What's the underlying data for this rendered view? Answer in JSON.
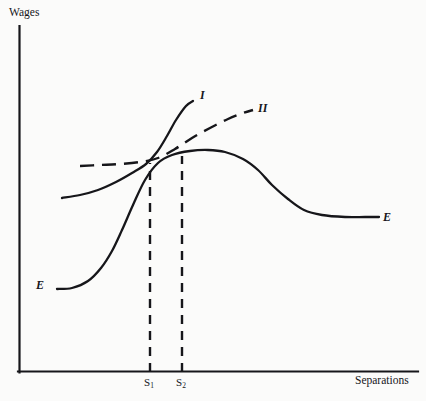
{
  "figure": {
    "background_color": "#fbfbfa",
    "ink_color": "#16161a",
    "width": 426,
    "height": 401
  },
  "axes": {
    "y_axis_label": "Wages",
    "x_axis_label": "Separations",
    "origin_px": {
      "x": 18,
      "y": 372
    },
    "x_axis_end_px": {
      "x": 418,
      "y": 372
    },
    "y_axis_top_px": {
      "x": 18,
      "y": 26
    }
  },
  "ticks": [
    {
      "name": "S1",
      "text": "S",
      "subscript": "1",
      "x_px": 150
    },
    {
      "name": "S2",
      "text": "S",
      "subscript": "2",
      "x_px": 182
    }
  ],
  "curve_labels": {
    "I": "I",
    "II": "II",
    "E_left": "E",
    "E_right": "E"
  },
  "chart_data": {
    "type": "line",
    "title": "",
    "subtitle": "",
    "xlabel": "Separations",
    "ylabel": "Wages",
    "xlim": [
      0,
      418
    ],
    "ylim": [
      0,
      372
    ],
    "grid": false,
    "legend": "inline-curve-end-labels",
    "axis_ticks_numeric": false,
    "annotations": [
      {
        "name": "s1-dropline",
        "label": "S1",
        "style": "dashed-vertical",
        "x_px": 150,
        "from_y_px": 372,
        "to_y_px": 163
      },
      {
        "name": "s2-dropline",
        "label": "S2",
        "style": "dashed-vertical",
        "x_px": 182,
        "from_y_px": 372,
        "to_y_px": 156
      }
    ],
    "series": [
      {
        "name": "E",
        "label": "E",
        "style": "solid",
        "description": "S-shaped employer wage-offer curve rising then peaking and falling",
        "points_px": [
          [
            57,
            289
          ],
          [
            72,
            288
          ],
          [
            88,
            281
          ],
          [
            101,
            268
          ],
          [
            112,
            251
          ],
          [
            122,
            230
          ],
          [
            133,
            205
          ],
          [
            145,
            180
          ],
          [
            158,
            163
          ],
          [
            172,
            155
          ],
          [
            190,
            151
          ],
          [
            208,
            150
          ],
          [
            225,
            152
          ],
          [
            243,
            159
          ],
          [
            258,
            170
          ],
          [
            272,
            185
          ],
          [
            288,
            199
          ],
          [
            304,
            210
          ],
          [
            322,
            215
          ],
          [
            345,
            217
          ],
          [
            365,
            217
          ],
          [
            379,
            217
          ]
        ]
      },
      {
        "name": "I",
        "label": "I",
        "style": "solid",
        "description": "Indifference curve I, flat at left then rising steeply through the crossing point",
        "points_px": [
          [
            62,
            198
          ],
          [
            80,
            195
          ],
          [
            98,
            190
          ],
          [
            116,
            182
          ],
          [
            132,
            173
          ],
          [
            146,
            164
          ],
          [
            157,
            152
          ],
          [
            167,
            136
          ],
          [
            176,
            120
          ],
          [
            186,
            106
          ],
          [
            193,
            101
          ]
        ]
      },
      {
        "name": "II",
        "label": "II",
        "style": "dashed",
        "description": "Indifference curve II, flat dashed at left then rising moderately to upper right",
        "points_px": [
          [
            80,
            166
          ],
          [
            100,
            165
          ],
          [
            120,
            164
          ],
          [
            140,
            162
          ],
          [
            158,
            158
          ],
          [
            175,
            149
          ],
          [
            192,
            138
          ],
          [
            210,
            128
          ],
          [
            228,
            119
          ],
          [
            243,
            113
          ],
          [
            253,
            110
          ]
        ]
      }
    ]
  }
}
